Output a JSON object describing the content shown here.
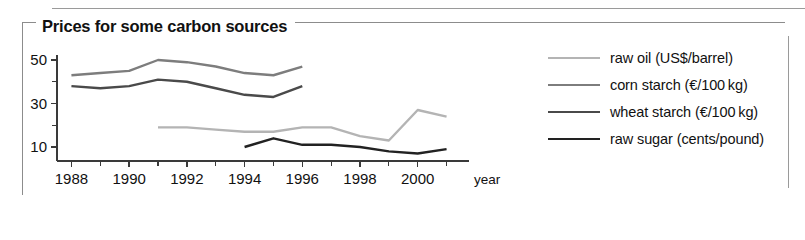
{
  "figure": {
    "title": "Prices for some carbon sources"
  },
  "legend": {
    "position": "right",
    "items": [
      {
        "label": "raw oil (US$/barrel)",
        "color": "#b4b4b4",
        "key": "raw_oil"
      },
      {
        "label": "corn starch (€/100 kg)",
        "color": "#7d7d7d",
        "key": "corn_starch"
      },
      {
        "label": "wheat starch (€/100 kg)",
        "color": "#4a4a4a",
        "key": "wheat_starch"
      },
      {
        "label": "raw sugar (cents/pound)",
        "color": "#222222",
        "key": "raw_sugar"
      }
    ]
  },
  "axes": {
    "x": {
      "label": "year",
      "ticks": [
        "1988",
        "1990",
        "1992",
        "1994",
        "1996",
        "1998",
        "2000"
      ],
      "tick_values": [
        1988,
        1990,
        1992,
        1994,
        1996,
        1998,
        2000
      ],
      "minor_every": 1,
      "range": [
        1987.5,
        2001.5
      ]
    },
    "y": {
      "label": "",
      "ticks": [
        "10",
        "30",
        "50"
      ],
      "tick_values": [
        10,
        30,
        50
      ],
      "minor_tick_values": [
        20,
        40
      ],
      "range": [
        0,
        54
      ]
    }
  },
  "chart_data": {
    "type": "line",
    "title": "Prices for some carbon sources",
    "xlabel": "year",
    "ylabel": "",
    "xlim": [
      1987.5,
      2001.5
    ],
    "ylim": [
      0,
      54
    ],
    "grid": false,
    "legend_position": "right",
    "series": [
      {
        "name": "raw oil (US$/barrel)",
        "color": "#b4b4b4",
        "x": [
          1991,
          1992,
          1993,
          1994,
          1995,
          1996,
          1997,
          1998,
          1999,
          2000,
          2001
        ],
        "values": [
          19,
          19,
          18,
          17,
          17,
          19,
          19,
          15,
          13,
          27,
          24
        ]
      },
      {
        "name": "corn starch (€/100 kg)",
        "color": "#7d7d7d",
        "x": [
          1988,
          1989,
          1990,
          1991,
          1992,
          1993,
          1994,
          1995,
          1996
        ],
        "values": [
          43,
          44,
          45,
          50,
          49,
          47,
          44,
          43,
          47
        ]
      },
      {
        "name": "wheat starch (€/100 kg)",
        "color": "#4a4a4a",
        "x": [
          1988,
          1989,
          1990,
          1991,
          1992,
          1993,
          1994,
          1995,
          1996
        ],
        "values": [
          38,
          37,
          38,
          41,
          40,
          37,
          34,
          33,
          38
        ]
      },
      {
        "name": "raw sugar (cents/pound)",
        "color": "#222222",
        "x": [
          1994,
          1995,
          1996,
          1997,
          1998,
          1999,
          2000,
          2001
        ],
        "values": [
          10,
          14,
          11,
          11,
          10,
          8,
          7,
          9
        ]
      }
    ]
  }
}
